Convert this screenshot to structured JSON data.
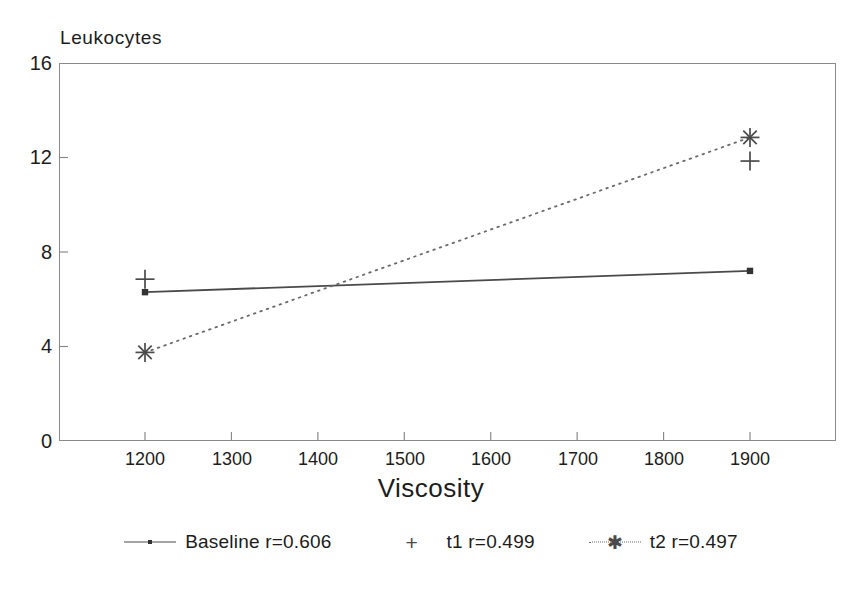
{
  "chart_data": {
    "type": "line",
    "title": "",
    "xlabel": "Viscosity",
    "ylabel": "Leukocytes",
    "x": [
      1200,
      1900
    ],
    "xlim": [
      1140,
      2035
    ],
    "ylim": [
      0,
      16
    ],
    "xticks": [
      1200,
      1300,
      1400,
      1500,
      1600,
      1700,
      1800,
      1900
    ],
    "yticks": [
      0,
      4,
      8,
      12,
      16
    ],
    "grid": false,
    "legend_position": "bottom",
    "series": [
      {
        "name": "Baseline r=0.606",
        "label": "Baseline r=0.606",
        "marker": "square",
        "line": "solid",
        "values": [
          6.3,
          7.2
        ]
      },
      {
        "name": "t1 r=0.499",
        "label": "t1 r=0.499",
        "marker": "plus",
        "line": "none",
        "values": [
          6.85,
          11.85
        ]
      },
      {
        "name": "t2 r=0.497",
        "label": "t2 r=0.497",
        "marker": "asterisk",
        "line": "dotted",
        "values": [
          3.75,
          12.85
        ]
      }
    ]
  },
  "axes": {
    "y_title": "Leukocytes",
    "x_title": "Viscosity",
    "y_tick_labels": [
      "16",
      "12",
      "8",
      "4",
      "0"
    ],
    "x_tick_labels": [
      "1200",
      "1300",
      "1400",
      "1500",
      "1600",
      "1700",
      "1800",
      "1900"
    ]
  },
  "legend": {
    "items": [
      {
        "label": "Baseline r=0.606"
      },
      {
        "label": "t1 r=0.499"
      },
      {
        "label": "t2 r=0.497"
      }
    ]
  },
  "colors": {
    "frame": "#8a8a8a",
    "baseline_line": "#4a4a4a",
    "t2_line": "#6a6a6a",
    "marker": "#333333",
    "text": "#1c1c1c",
    "background": "#ffffff"
  }
}
